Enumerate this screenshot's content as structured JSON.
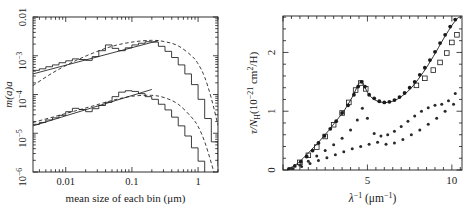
{
  "figure": {
    "name": "dust-grain-size-and-extinction-figure",
    "panels": [
      "size-distribution-panel",
      "extinction-curve-panel"
    ]
  },
  "left_panel": {
    "name": "grain-size-distribution",
    "xlabel": "mean size of each bin (μm)",
    "ylabel_main": "m(a)a",
    "x_tick_labels": [
      "0.01",
      "0.1",
      "1"
    ],
    "y_tick_labels": [
      "0.01",
      "10",
      "10",
      "10",
      "10"
    ],
    "y_tick_exponents": [
      "",
      "−3",
      "−4",
      "−5",
      "−6"
    ]
  },
  "right_panel": {
    "name": "extinction-curve",
    "xlabel_base": "λ",
    "xlabel_exp": "−1",
    "xlabel_unit": " (μm",
    "xlabel_unit_exp": "−1",
    "xlabel_unit_close": ")",
    "ylabel_tau": "τ/N",
    "ylabel_sub": "H",
    "ylabel_rest": "(10",
    "ylabel_exp": "−21",
    "ylabel_units": " cm",
    "ylabel_units_exp": "2",
    "ylabel_units_close": "/H)",
    "x_tick_labels": [
      "5",
      "10"
    ],
    "y_tick_labels": [
      "0",
      "1",
      "2"
    ]
  },
  "chart_data": [
    {
      "type": "line",
      "name": "grain-size-distribution",
      "title": "",
      "xlabel": "mean size of each bin (μm)",
      "ylabel": "m(a)a",
      "xscale": "log",
      "yscale": "log",
      "xlim": [
        0.0032,
        2.0
      ],
      "ylim": [
        1e-06,
        0.01
      ],
      "grid": false,
      "legend": "none",
      "xticks": [
        0.01,
        0.1,
        1
      ],
      "yticks": [
        1e-06,
        1e-05,
        0.0001,
        0.001,
        0.01
      ],
      "series": [
        {
          "name": "upper-histogram",
          "style": "step-solid",
          "x": [
            0.0032,
            0.004,
            0.005,
            0.0063,
            0.0079,
            0.01,
            0.0126,
            0.0158,
            0.02,
            0.0251,
            0.0316,
            0.0398,
            0.0501,
            0.0631,
            0.0794,
            0.1,
            0.1259,
            0.1585,
            0.1995,
            0.2512,
            0.3162,
            0.3981,
            0.5012,
            0.631,
            0.7943,
            1.0,
            1.2589,
            1.5849,
            2.0
          ],
          "y": [
            0.00042,
            0.00046,
            0.00052,
            0.00058,
            0.00066,
            0.00074,
            0.00083,
            0.0008,
            0.00076,
            0.00095,
            0.00135,
            0.0019,
            0.00155,
            0.00135,
            0.0016,
            0.0019,
            0.0021,
            0.0023,
            0.00225,
            0.00175,
            0.0013,
            0.0009,
            0.00058,
            0.00034,
            0.00018,
            7.5e-05,
            2.4e-05,
            6e-06,
            1.4e-06
          ]
        },
        {
          "name": "upper-powerlaw-line",
          "style": "straight-solid",
          "x": [
            0.0032,
            0.2512
          ],
          "y": [
            0.00034,
            0.00245
          ]
        },
        {
          "name": "upper-dashed-model",
          "style": "smooth-dashed",
          "x": [
            0.0032,
            0.0063,
            0.0126,
            0.0251,
            0.0501,
            0.1,
            0.1995,
            0.3162,
            0.5012,
            0.7943,
            1.0,
            1.2589,
            1.5849,
            2.0
          ],
          "y": [
            0.00017,
            0.00036,
            0.00068,
            0.00115,
            0.00175,
            0.00225,
            0.0025,
            0.0023,
            0.0018,
            0.001,
            0.00062,
            0.00028,
            8e-05,
            1.6e-05
          ]
        },
        {
          "name": "lower-histogram",
          "style": "step-solid",
          "x": [
            0.0032,
            0.004,
            0.005,
            0.0063,
            0.0079,
            0.01,
            0.0126,
            0.0158,
            0.02,
            0.0251,
            0.0316,
            0.0398,
            0.0501,
            0.0631,
            0.0794,
            0.1,
            0.1259,
            0.1585,
            0.1995,
            0.2512,
            0.3162,
            0.3981,
            0.5012,
            0.631,
            0.7943,
            1.0,
            1.2589,
            1.5849,
            2.0
          ],
          "y": [
            1.7e-05,
            1.9e-05,
            2.2e-05,
            2.5e-05,
            2.9e-05,
            3.6e-05,
            4.4e-05,
            4.1e-05,
            3.6e-05,
            4.3e-05,
            5.2e-05,
            6.3e-05,
            8.8e-05,
            0.000115,
            0.000125,
            0.00012,
            0.000105,
            8.8e-05,
            7.5e-05,
            5.6e-05,
            4e-05,
            2.6e-05,
            1.55e-05,
            8.5e-06,
            4.2e-06,
            1.9e-06,
            7e-07,
            2e-07,
            1.2e-07
          ]
        },
        {
          "name": "lower-powerlaw-line",
          "style": "straight-solid",
          "x": [
            0.0032,
            0.2
          ],
          "y": [
            1.55e-05,
            0.000135
          ]
        },
        {
          "name": "lower-dashed-model",
          "style": "smooth-dashed",
          "x": [
            0.0032,
            0.0063,
            0.0126,
            0.0251,
            0.0501,
            0.1,
            0.1995,
            0.3162,
            0.5012,
            0.7943,
            1.0,
            1.2589,
            1.5849,
            2.0
          ],
          "y": [
            1.9e-05,
            2.6e-05,
            3.6e-05,
            5e-05,
            7e-05,
            9e-05,
            9.5e-05,
            8.2e-05,
            5.6e-05,
            2.6e-05,
            1.5e-05,
            6e-06,
            1.7e-06,
            4e-07
          ]
        }
      ]
    },
    {
      "type": "scatter",
      "name": "interstellar-extinction-curve",
      "title": "",
      "xlabel": "λ⁻¹ (μm⁻¹)",
      "ylabel": "τ/N_H (10⁻²¹ cm²/H)",
      "xscale": "linear",
      "yscale": "linear",
      "xlim": [
        0,
        10.6
      ],
      "ylim": [
        0,
        2.62
      ],
      "grid": false,
      "legend": "none",
      "xticks": [
        5,
        10
      ],
      "yticks": [
        0,
        1,
        2
      ],
      "series": [
        {
          "name": "total-extinction-model-curve",
          "style": "solid-line",
          "x": [
            0.3,
            0.6,
            0.9,
            1.2,
            1.5,
            1.8,
            2.1,
            2.4,
            2.7,
            3.0,
            3.3,
            3.6,
            3.9,
            4.1,
            4.3,
            4.45,
            4.6,
            4.7,
            4.8,
            4.95,
            5.1,
            5.3,
            5.6,
            5.9,
            6.2,
            6.5,
            6.8,
            7.1,
            7.4,
            7.7,
            8.0,
            8.3,
            8.6,
            8.9,
            9.2,
            9.5,
            9.8,
            10.1,
            10.4
          ],
          "y": [
            0.02,
            0.06,
            0.12,
            0.2,
            0.29,
            0.38,
            0.47,
            0.57,
            0.67,
            0.78,
            0.89,
            1.0,
            1.14,
            1.24,
            1.36,
            1.45,
            1.5,
            1.49,
            1.44,
            1.35,
            1.28,
            1.22,
            1.17,
            1.15,
            1.15,
            1.17,
            1.21,
            1.27,
            1.34,
            1.43,
            1.54,
            1.66,
            1.79,
            1.93,
            2.08,
            2.23,
            2.37,
            2.5,
            2.6
          ]
        },
        {
          "name": "observed-extinction-filled-points",
          "style": "filled-circles",
          "x": [
            0.35,
            0.7,
            1.05,
            1.4,
            1.75,
            2.1,
            2.45,
            2.8,
            3.15,
            3.5,
            3.85,
            4.2,
            4.45,
            4.65,
            4.85,
            5.1,
            5.4,
            5.7,
            6.0,
            6.3,
            6.6,
            6.9,
            7.2,
            7.5,
            7.8,
            8.1,
            8.4,
            8.7,
            9.0,
            9.3,
            9.6,
            9.9,
            10.2
          ],
          "y": [
            0.02,
            0.07,
            0.14,
            0.23,
            0.33,
            0.46,
            0.58,
            0.7,
            0.83,
            0.97,
            1.1,
            1.28,
            1.42,
            1.5,
            1.42,
            1.28,
            1.22,
            1.17,
            1.15,
            1.16,
            1.19,
            1.24,
            1.31,
            1.4,
            1.5,
            1.62,
            1.74,
            1.87,
            2.01,
            2.16,
            2.3,
            2.44,
            2.56
          ]
        },
        {
          "name": "model-open-squares",
          "style": "open-squares",
          "x": [
            1.0,
            1.5,
            2.0,
            2.5,
            3.0,
            3.5,
            3.9,
            4.3,
            4.6,
            4.9,
            7.9,
            8.4,
            8.9,
            9.3,
            9.7,
            10.0,
            10.3
          ],
          "y": [
            0.13,
            0.25,
            0.39,
            0.57,
            0.77,
            0.97,
            1.15,
            1.36,
            1.48,
            1.38,
            1.44,
            1.56,
            1.7,
            1.83,
            1.99,
            2.17,
            2.3
          ]
        },
        {
          "name": "silicate-component-points",
          "style": "small-filled-circles",
          "x": [
            0.5,
            1.0,
            1.5,
            2.0,
            2.5,
            3.0,
            3.5,
            4.0,
            4.4,
            4.7,
            5.0,
            5.4,
            5.8,
            6.2,
            6.6,
            7.0,
            7.4,
            7.8,
            8.2,
            8.6,
            9.0,
            9.4,
            9.8,
            10.2
          ],
          "y": [
            0.03,
            0.08,
            0.15,
            0.24,
            0.33,
            0.43,
            0.54,
            0.68,
            0.85,
            1.05,
            0.88,
            0.62,
            0.58,
            0.6,
            0.66,
            0.74,
            0.83,
            0.92,
            1.0,
            1.06,
            1.1,
            1.12,
            1.18,
            1.3
          ]
        },
        {
          "name": "graphite-component-points",
          "style": "small-filled-circles-lower",
          "x": [
            0.6,
            1.1,
            1.6,
            2.1,
            2.6,
            3.1,
            3.6,
            4.1,
            4.6,
            5.1,
            5.6,
            6.1,
            6.6,
            7.1,
            7.6,
            8.1,
            8.6,
            9.1,
            9.6,
            10.1
          ],
          "y": [
            0.02,
            0.06,
            0.11,
            0.16,
            0.21,
            0.26,
            0.31,
            0.36,
            0.4,
            0.44,
            0.47,
            0.44,
            0.46,
            0.52,
            0.6,
            0.68,
            0.78,
            0.88,
            1.0,
            1.12
          ]
        }
      ]
    }
  ]
}
